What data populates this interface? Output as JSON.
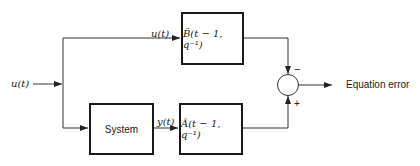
{
  "diagram": {
    "input_label": "u(t)",
    "upper_branch_label": "u(t)",
    "system_output_label": "y(t)",
    "blocks": {
      "b_hat": "B̂(t − 1, q⁻¹)",
      "system": "System",
      "a_hat": "Â(t − 1, q⁻¹)"
    },
    "summing_junction": {
      "minus_sign": "−",
      "plus_sign": "+"
    },
    "output_label": "Equation error"
  }
}
